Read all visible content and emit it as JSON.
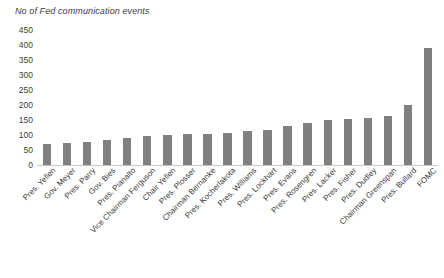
{
  "chart_data": {
    "type": "bar",
    "title": "No of Fed communication events",
    "xlabel": "",
    "ylabel": "",
    "ylim": [
      0,
      450
    ],
    "ytick_step": 50,
    "yticks": [
      450,
      400,
      350,
      300,
      250,
      200,
      150,
      100,
      50,
      0
    ],
    "grid": false,
    "legend": null,
    "bar_color": "#7f7f7f",
    "background_color": "#ffffff",
    "axis_color": "#c8c8c8",
    "categories": [
      "Pres. Yellen",
      "Gov. Meyer",
      "Pres. Parry",
      "Gov. Bies",
      "Pres. Pianalto",
      "Vice Chairman Ferguson",
      "Chair Yellen",
      "Pres. Plosser",
      "Chairman Bernanke",
      "Pres. Kocherlakota",
      "Pres. Williams",
      "Pres. Lockhart",
      "Pres. Evans",
      "Pres. Rosengren",
      "Pres. Lacker",
      "Pres. Fisher",
      "Pres. Dudley",
      "Chairman Greenspan",
      "Pres. Bullard",
      "FOMC"
    ],
    "values": [
      70,
      75,
      78,
      82,
      90,
      98,
      100,
      105,
      105,
      108,
      112,
      118,
      130,
      140,
      150,
      152,
      158,
      165,
      200,
      390
    ]
  },
  "chart": {
    "title": "No of Fed communication events"
  }
}
